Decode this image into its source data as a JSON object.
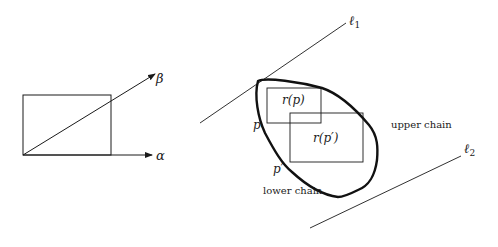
{
  "left_figure": {
    "axis_x_label": "α",
    "axis_y_label": "β"
  },
  "right_figure": {
    "line1_label": "ℓ",
    "line1_sub": "1",
    "line2_label": "ℓ",
    "line2_sub": "2",
    "point_p": "p",
    "point_p_prime": "p′",
    "rect_p_label": "r(p)",
    "rect_p_prime_label": "r(p′)",
    "upper_chain_label": "upper chain",
    "lower_chain_label": "lower chain"
  },
  "colors": {
    "stroke": "#1a1a1a",
    "background": "#ffffff"
  }
}
